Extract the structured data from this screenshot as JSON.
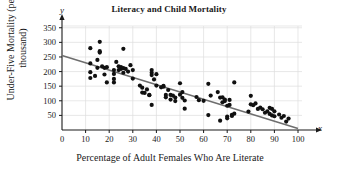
{
  "chart_data": {
    "type": "scatter",
    "title": "Literacy and Child Mortality",
    "xlabel": "Percentage of Adult Females Who Are Literate",
    "ylabel": "Under-Five Mortality (per thousand)",
    "x_axis_name": "x",
    "y_axis_name": "y",
    "xlim": [
      0,
      100
    ],
    "ylim": [
      0,
      380
    ],
    "xticks": [
      0,
      10,
      20,
      30,
      40,
      50,
      60,
      70,
      80,
      90,
      100
    ],
    "yticks": [
      50,
      100,
      150,
      200,
      250,
      300,
      350
    ],
    "xtick_labels": [
      "0",
      "10",
      "20",
      "30",
      "40",
      "50",
      "60",
      "70",
      "80",
      "90",
      "100"
    ],
    "ytick_labels": [
      "50",
      "100",
      "150",
      "200",
      "250",
      "300",
      "350"
    ],
    "grid": true,
    "legend": "none",
    "point_color": "#101010",
    "line_color": "#6e6e6e",
    "grid_color": "#dedede",
    "axis_color": "#1a1a1a",
    "trend_line": {
      "x": [
        0,
        100
      ],
      "y": [
        255,
        5
      ]
    },
    "points": [
      [
        12,
        280
      ],
      [
        12,
        228
      ],
      [
        12,
        198
      ],
      [
        12,
        178
      ],
      [
        14,
        185
      ],
      [
        15,
        240
      ],
      [
        15,
        213
      ],
      [
        16,
        302
      ],
      [
        16,
        265
      ],
      [
        16,
        270
      ],
      [
        17,
        218
      ],
      [
        18,
        213
      ],
      [
        18,
        190
      ],
      [
        19,
        215
      ],
      [
        19,
        163
      ],
      [
        22,
        205
      ],
      [
        22,
        192
      ],
      [
        22,
        175
      ],
      [
        22,
        163
      ],
      [
        23,
        233
      ],
      [
        24,
        218
      ],
      [
        24,
        205
      ],
      [
        25,
        209
      ],
      [
        25,
        215
      ],
      [
        26,
        278
      ],
      [
        26,
        212
      ],
      [
        26,
        196
      ],
      [
        27,
        209
      ],
      [
        28,
        200
      ],
      [
        29,
        222
      ],
      [
        30,
        205
      ],
      [
        30,
        176
      ],
      [
        33,
        152
      ],
      [
        34,
        145
      ],
      [
        34,
        128
      ],
      [
        35,
        127
      ],
      [
        36,
        139
      ],
      [
        37,
        119
      ],
      [
        37,
        120
      ],
      [
        38,
        205
      ],
      [
        38,
        196
      ],
      [
        38,
        188
      ],
      [
        38,
        86
      ],
      [
        39,
        173
      ],
      [
        40,
        191
      ],
      [
        40,
        152
      ],
      [
        42,
        146
      ],
      [
        43,
        151
      ],
      [
        43,
        148
      ],
      [
        44,
        120
      ],
      [
        44,
        112
      ],
      [
        45,
        137
      ],
      [
        46,
        120
      ],
      [
        46,
        104
      ],
      [
        47,
        118
      ],
      [
        48,
        111
      ],
      [
        48,
        99
      ],
      [
        50,
        160
      ],
      [
        50,
        121
      ],
      [
        51,
        130
      ],
      [
        51,
        110
      ],
      [
        52,
        101
      ],
      [
        52,
        73
      ],
      [
        57,
        113
      ],
      [
        58,
        102
      ],
      [
        60,
        100
      ],
      [
        62,
        158
      ],
      [
        62,
        51
      ],
      [
        63,
        118
      ],
      [
        66,
        130
      ],
      [
        67,
        111
      ],
      [
        67,
        32
      ],
      [
        68,
        112
      ],
      [
        68,
        95
      ],
      [
        69,
        104
      ],
      [
        69,
        99
      ],
      [
        70,
        83
      ],
      [
        70,
        46
      ],
      [
        70,
        40
      ],
      [
        71,
        103
      ],
      [
        71,
        86
      ],
      [
        72,
        52
      ],
      [
        72,
        48
      ],
      [
        73,
        163
      ],
      [
        73,
        56
      ],
      [
        79,
        63
      ],
      [
        80,
        117
      ],
      [
        80,
        88
      ],
      [
        81,
        85
      ],
      [
        82,
        91
      ],
      [
        83,
        72
      ],
      [
        84,
        77
      ],
      [
        85,
        71
      ],
      [
        86,
        59
      ],
      [
        87,
        64
      ],
      [
        88,
        76
      ],
      [
        88,
        55
      ],
      [
        89,
        72
      ],
      [
        89,
        50
      ],
      [
        90,
        64
      ],
      [
        90,
        47
      ],
      [
        92,
        53
      ],
      [
        93,
        42
      ],
      [
        94,
        48
      ],
      [
        95,
        29
      ],
      [
        96,
        39
      ]
    ]
  }
}
